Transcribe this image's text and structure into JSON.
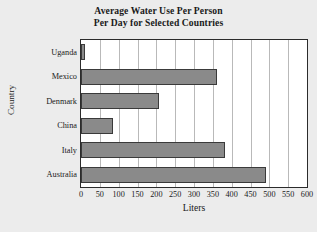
{
  "chart_data": {
    "type": "bar",
    "orientation": "horizontal",
    "title": "Average Water Use Per Person Per Day for Selected Countries",
    "title_lines": [
      "Average Water Use Per Person",
      "Per Day for Selected Countries"
    ],
    "categories": [
      "Uganda",
      "Mexico",
      "Denmark",
      "China",
      "Italy",
      "Australia"
    ],
    "values": [
      10,
      360,
      208,
      85,
      383,
      490
    ],
    "xlabel": "Liters",
    "ylabel": "Country",
    "xlim": [
      0,
      600
    ],
    "xticks": [
      0,
      50,
      100,
      150,
      200,
      250,
      300,
      350,
      400,
      450,
      500,
      550,
      600
    ],
    "xtick_labels": [
      "0",
      "50",
      "100",
      "150",
      "200",
      "250",
      "300",
      "350",
      "400",
      "450",
      "500",
      "550",
      "600"
    ],
    "grid": "vertical",
    "legend": null,
    "bar_color": "#8a8a8a",
    "bar_edge_color": "#3a3a3a",
    "plot_background": "#ffffff",
    "figure_background": "#ececec",
    "axis_color": "#2b2b2b",
    "gridline_color": "#b9b9b9"
  }
}
